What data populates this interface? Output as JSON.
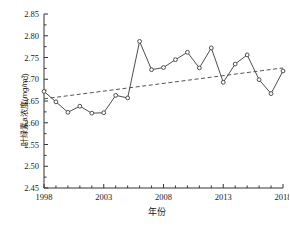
{
  "chart_data": {
    "type": "line",
    "title": "",
    "xlabel": "年份",
    "ylabel": "叶绿素a浓度(mg/m³)",
    "xlim": [
      1998,
      2018
    ],
    "ylim": [
      2.45,
      2.85
    ],
    "xticks": [
      1998,
      2003,
      2008,
      2013,
      2018
    ],
    "xtick_labels": [
      "1998",
      "2003",
      "2008",
      "2013",
      "2018"
    ],
    "yticks": [
      2.45,
      2.5,
      2.55,
      2.6,
      2.65,
      2.7,
      2.75,
      2.8,
      2.85
    ],
    "ytick_labels": [
      "2.45",
      "2.50",
      "2.55",
      "2.60",
      "2.65",
      "2.70",
      "2.75",
      "2.80",
      "2.85"
    ],
    "grid": false,
    "legend": null,
    "series": [
      {
        "name": "叶绿素a浓度",
        "style": "line-marker",
        "color": "#4d4d4d",
        "marker": "circle",
        "x": [
          1998,
          1999,
          2000,
          2001,
          2002,
          2003,
          2004,
          2005,
          2006,
          2007,
          2008,
          2009,
          2010,
          2011,
          2012,
          2013,
          2014,
          2015,
          2016,
          2017,
          2018
        ],
        "values": [
          2.672,
          2.648,
          2.624,
          2.638,
          2.622,
          2.623,
          2.663,
          2.657,
          2.787,
          2.722,
          2.727,
          2.745,
          2.762,
          2.726,
          2.772,
          2.693,
          2.735,
          2.756,
          2.699,
          2.667,
          2.719
        ]
      },
      {
        "name": "线性趋势线",
        "style": "dashed-line",
        "color": "#555555",
        "x": [
          1998,
          2018
        ],
        "values": [
          2.655,
          2.726
        ]
      }
    ]
  },
  "axis": {
    "ylabel_text": "叶绿素a浓度(mg/m³)",
    "xlabel_text": "年份"
  }
}
